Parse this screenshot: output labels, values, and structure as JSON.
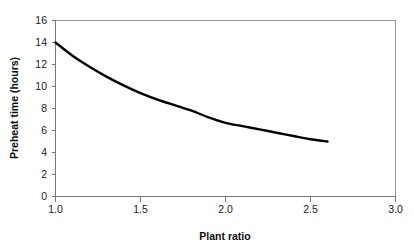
{
  "chart_data": {
    "type": "line",
    "title": "",
    "xlabel": "Plant ratio",
    "ylabel": "Preheat time (hours)",
    "xlim": [
      1.0,
      3.0
    ],
    "ylim": [
      0,
      16
    ],
    "grid": false,
    "legend": null,
    "xticks": [
      "1.0",
      "1.5",
      "2.0",
      "2.5",
      "3.0"
    ],
    "xtick_values": [
      1.0,
      1.5,
      2.0,
      2.5,
      3.0
    ],
    "yticks": [
      "0",
      "2",
      "4",
      "6",
      "8",
      "10",
      "12",
      "14",
      "16"
    ],
    "ytick_values": [
      0,
      2,
      4,
      6,
      8,
      10,
      12,
      14,
      16
    ],
    "series": [
      {
        "name": "Preheat time",
        "color": "#000000",
        "x": [
          1.0,
          1.1,
          1.2,
          1.3,
          1.4,
          1.5,
          1.6,
          1.7,
          1.8,
          1.9,
          2.0,
          2.1,
          2.2,
          2.3,
          2.4,
          2.5,
          2.6
        ],
        "values": [
          14.0,
          12.8,
          11.8,
          10.9,
          10.1,
          9.4,
          8.8,
          8.3,
          7.8,
          7.2,
          6.7,
          6.4,
          6.1,
          5.8,
          5.5,
          5.2,
          5.0
        ]
      }
    ]
  },
  "axes": {
    "x_title": "Plant ratio",
    "y_title": "Preheat time (hours)"
  }
}
